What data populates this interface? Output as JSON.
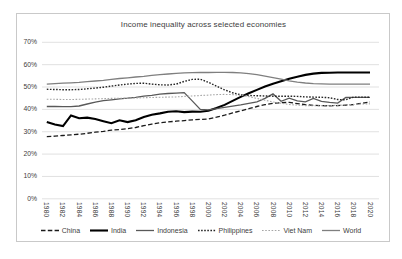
{
  "chart_data": {
    "type": "line",
    "title": "Income inequality across selected economies",
    "xlabel": "",
    "ylabel": "",
    "ylim": [
      0,
      70
    ],
    "grid": "horizontal-only",
    "legend_position": "bottom",
    "y_tick_labels": [
      "70%",
      "60%",
      "50%",
      "40%",
      "30%",
      "20%",
      "10%",
      "0%"
    ],
    "x_tick_labels": [
      "1980",
      "1982",
      "1984",
      "1986",
      "1988",
      "1990",
      "1992",
      "1994",
      "1996",
      "1998",
      "2000",
      "2002",
      "2004",
      "2006",
      "2008",
      "2010",
      "2012",
      "2014",
      "2016",
      "2018",
      "2020"
    ],
    "x": [
      1980,
      1981,
      1982,
      1983,
      1984,
      1985,
      1986,
      1987,
      1988,
      1989,
      1990,
      1991,
      1992,
      1993,
      1994,
      1995,
      1996,
      1997,
      1998,
      1999,
      2000,
      2001,
      2002,
      2003,
      2004,
      2005,
      2006,
      2007,
      2008,
      2009,
      2010,
      2011,
      2012,
      2013,
      2014,
      2015,
      2016,
      2017,
      2018,
      2019,
      2020
    ],
    "series": [
      {
        "name": "China",
        "color": "#1a1a1a",
        "dash": "4.5 2.3",
        "width": 1.3,
        "values": [
          27.8,
          28.0,
          28.3,
          28.6,
          28.9,
          29.3,
          29.8,
          30.2,
          30.7,
          31.0,
          31.4,
          31.9,
          32.7,
          33.4,
          34.0,
          34.4,
          34.7,
          35.0,
          35.3,
          35.5,
          35.7,
          36.5,
          37.4,
          38.4,
          39.3,
          40.3,
          41.3,
          42.1,
          42.7,
          43.0,
          43.1,
          42.6,
          42.1,
          41.8,
          41.7,
          41.6,
          41.7,
          41.9,
          42.2,
          42.7,
          43.3
        ]
      },
      {
        "name": "India",
        "color": "#000000",
        "dash": "",
        "width": 2.1,
        "values": [
          34.4,
          33.2,
          32.5,
          37.3,
          36.0,
          36.3,
          35.7,
          34.7,
          33.8,
          35.1,
          34.3,
          35.1,
          36.6,
          37.6,
          38.2,
          38.9,
          39.2,
          38.8,
          39.0,
          38.9,
          39.4,
          40.6,
          42.0,
          43.8,
          45.6,
          47.2,
          48.7,
          50.2,
          51.5,
          52.6,
          53.7,
          54.6,
          55.4,
          56.0,
          56.3,
          56.4,
          56.5,
          56.5,
          56.5,
          56.5,
          56.5
        ]
      },
      {
        "name": "Indonesia",
        "color": "#595959",
        "dash": "",
        "width": 1.3,
        "values": [
          41.3,
          41.3,
          41.2,
          41.2,
          41.5,
          42.4,
          43.2,
          43.9,
          44.3,
          44.7,
          45.0,
          45.4,
          45.9,
          46.3,
          46.8,
          47.1,
          47.3,
          47.5,
          43.8,
          40.0,
          39.8,
          40.3,
          40.9,
          41.4,
          42.0,
          42.7,
          43.4,
          44.9,
          46.9,
          43.6,
          45.0,
          43.8,
          43.4,
          44.9,
          43.6,
          43.1,
          42.8,
          45.3,
          45.4,
          45.4,
          45.4
        ]
      },
      {
        "name": "Philippines",
        "color": "#262626",
        "dash": "1.6 1.5",
        "width": 1.4,
        "values": [
          49.0,
          48.9,
          48.8,
          48.8,
          48.9,
          49.2,
          49.5,
          49.9,
          50.4,
          50.9,
          51.3,
          51.6,
          51.7,
          51.3,
          51.0,
          50.9,
          51.3,
          52.5,
          53.4,
          53.5,
          52.1,
          50.4,
          48.7,
          47.4,
          46.5,
          46.2,
          46.1,
          46.0,
          45.9,
          45.9,
          45.9,
          45.8,
          45.6,
          45.5,
          45.4,
          45.2,
          44.4,
          44.3,
          45.5,
          45.5,
          45.4
        ]
      },
      {
        "name": "Viet Nam",
        "color": "#a6a6a6",
        "dash": "1.6 1.6",
        "width": 1.1,
        "values": [
          44.5,
          44.5,
          44.4,
          44.4,
          44.5,
          44.6,
          44.7,
          44.8,
          44.9,
          45.0,
          45.0,
          45.1,
          45.2,
          45.3,
          45.4,
          45.5,
          45.6,
          45.8,
          46.0,
          46.2,
          46.4,
          46.6,
          46.7,
          46.6,
          46.3,
          45.7,
          44.9,
          44.1,
          43.3,
          42.7,
          42.2,
          41.9,
          41.7,
          41.6,
          41.6,
          41.7,
          41.8,
          42.0,
          42.2,
          42.4,
          42.5
        ]
      },
      {
        "name": "World",
        "color": "#7f7f7f",
        "dash": "",
        "width": 1.3,
        "values": [
          51.3,
          51.5,
          51.7,
          51.9,
          52.1,
          52.4,
          52.7,
          53.0,
          53.4,
          53.8,
          54.1,
          54.5,
          54.8,
          55.2,
          55.5,
          55.8,
          56.1,
          56.3,
          56.4,
          56.5,
          56.5,
          56.6,
          56.6,
          56.5,
          56.3,
          56.0,
          55.5,
          54.9,
          54.2,
          53.5,
          52.8,
          52.2,
          51.8,
          51.5,
          51.4,
          51.3,
          51.3,
          51.3,
          51.3,
          51.3,
          51.3
        ]
      }
    ],
    "gridline_color": "#d9d9d9",
    "frame_border_color": "#c9c9c9",
    "text_color": "#404040"
  }
}
